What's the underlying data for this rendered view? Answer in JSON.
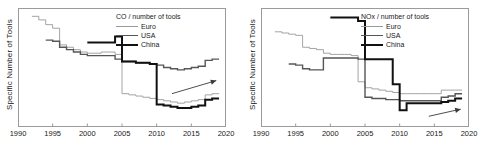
{
  "figure": {
    "width": 486,
    "height": 160,
    "background": "#ffffff"
  },
  "colors": {
    "euro": "#9a9a9a",
    "usa": "#565656",
    "china": "#111111",
    "axis": "#9b9b9b",
    "text": "#1a1a1a",
    "arrow": "#3a3a3a"
  },
  "panels": [
    {
      "id": "co-panel",
      "ylabel": "Specific Number of Tools",
      "legend": {
        "title": "CO / number of tools",
        "entries": [
          {
            "label": "Euro",
            "color": "#9a9a9a",
            "width": 0.9
          },
          {
            "label": "USA",
            "color": "#565656",
            "width": 1.4
          },
          {
            "label": "China",
            "color": "#111111",
            "width": 2.0
          }
        ]
      },
      "annotation": {
        "type": "arrow",
        "label": ""
      }
    },
    {
      "id": "nox-panel",
      "ylabel": "Specific Number of Tools",
      "legend": {
        "title": "NOx / number of tools",
        "entries": [
          {
            "label": "Euro",
            "color": "#9a9a9a",
            "width": 0.9
          },
          {
            "label": "USA",
            "color": "#565656",
            "width": 1.4
          },
          {
            "label": "China",
            "color": "#111111",
            "width": 2.0
          }
        ]
      },
      "annotation": {
        "type": "arrow",
        "label": ""
      }
    }
  ],
  "chart_data": [
    {
      "type": "line",
      "id": "co-chart",
      "title": "CO / number of tools",
      "xlabel": "",
      "ylabel": "Specific Number of Tools",
      "xlim": [
        1990,
        2020
      ],
      "ylim": [
        0,
        100
      ],
      "xticks": [
        1990,
        1995,
        2000,
        2005,
        2010,
        2015,
        2020
      ],
      "yticks": [],
      "grid": false,
      "legend_position": "top-right",
      "step": "post",
      "series": [
        {
          "name": "Euro",
          "color": "#9a9a9a",
          "x": [
            1992,
            1993,
            1994,
            1995,
            1996,
            1997,
            1998,
            1999,
            2000,
            2001,
            2002,
            2003,
            2004,
            2005,
            2006,
            2007,
            2008,
            2009,
            2010,
            2011,
            2012,
            2013,
            2014,
            2015,
            2016,
            2017,
            2018,
            2019
          ],
          "values": [
            93,
            90,
            86,
            83,
            69,
            67,
            65,
            63,
            62,
            62,
            63,
            63,
            61,
            28,
            27,
            26,
            25,
            24,
            23,
            22,
            21,
            20,
            21,
            22,
            23,
            27,
            28,
            28
          ]
        },
        {
          "name": "USA",
          "color": "#565656",
          "x": [
            1994,
            1995,
            1996,
            1997,
            1998,
            1999,
            2000,
            2001,
            2002,
            2003,
            2004,
            2005,
            2006,
            2007,
            2008,
            2009,
            2010,
            2011,
            2012,
            2013,
            2014,
            2015,
            2016,
            2017,
            2018,
            2019
          ],
          "values": [
            73,
            72,
            67,
            65,
            63,
            61,
            60,
            60,
            60,
            60,
            57,
            55,
            55,
            54,
            54,
            53,
            52,
            50,
            49,
            48,
            49,
            50,
            51,
            56,
            57,
            57
          ]
        },
        {
          "name": "China",
          "color": "#111111",
          "x": [
            2000,
            2001,
            2002,
            2003,
            2004,
            2005,
            2006,
            2007,
            2008,
            2009,
            2010,
            2011,
            2012,
            2013,
            2014,
            2015,
            2016,
            2017,
            2018,
            2019
          ],
          "values": [
            71,
            71,
            71,
            71,
            76,
            55,
            55,
            54,
            54,
            53,
            19,
            18,
            17,
            16,
            16,
            17,
            18,
            23,
            24,
            24
          ]
        }
      ],
      "annotations": [
        {
          "type": "arrow",
          "x_start": 2012.2,
          "y_start": 28,
          "x_end": 2018.6,
          "y_end": 39
        }
      ]
    },
    {
      "type": "line",
      "id": "nox-chart",
      "title": "NOx / number of tools",
      "xlabel": "",
      "ylabel": "Specific Number of Tools",
      "xlim": [
        1990,
        2020
      ],
      "ylim": [
        0,
        100
      ],
      "xticks": [
        1990,
        1995,
        2000,
        2005,
        2010,
        2015,
        2020
      ],
      "yticks": [],
      "grid": false,
      "legend_position": "top-right",
      "step": "post",
      "series": [
        {
          "name": "Euro",
          "color": "#9a9a9a",
          "x": [
            1992,
            1993,
            1994,
            1995,
            1996,
            1997,
            1998,
            1999,
            2000,
            2001,
            2002,
            2003,
            2004,
            2005,
            2006,
            2007,
            2008,
            2009,
            2010,
            2011,
            2012,
            2013,
            2014,
            2015,
            2016,
            2017,
            2018,
            2019
          ],
          "values": [
            80,
            79,
            78,
            77,
            67,
            66,
            65,
            62,
            61,
            61,
            61,
            60,
            38,
            33,
            32,
            31,
            30,
            29,
            28,
            28,
            28,
            28,
            28,
            28,
            31,
            31,
            31,
            31
          ]
        },
        {
          "name": "USA",
          "color": "#565656",
          "x": [
            1994,
            1995,
            1996,
            1997,
            1998,
            1999,
            2000,
            2001,
            2002,
            2003,
            2004,
            2005,
            2006,
            2007,
            2008,
            2009,
            2010,
            2011,
            2012,
            2013,
            2014,
            2015,
            2016,
            2017,
            2018,
            2019
          ],
          "values": [
            53,
            52,
            49,
            48,
            48,
            58,
            58,
            58,
            58,
            58,
            57,
            25,
            24,
            24,
            23,
            23,
            22,
            22,
            22,
            22,
            22,
            22,
            25,
            26,
            28,
            28
          ]
        },
        {
          "name": "China",
          "color": "#111111",
          "x": [
            2000,
            2001,
            2002,
            2003,
            2004,
            2005,
            2006,
            2007,
            2008,
            2009,
            2010,
            2011,
            2012,
            2013,
            2014,
            2015,
            2016,
            2017,
            2018,
            2019
          ],
          "values": [
            92,
            92,
            92,
            92,
            89,
            57,
            57,
            57,
            57,
            36,
            14,
            20,
            20,
            20,
            20,
            20,
            21,
            22,
            24,
            24
          ]
        }
      ],
      "annotations": [
        {
          "type": "arrow",
          "x_start": 2014.2,
          "y_start": 9,
          "x_end": 2018.8,
          "y_end": 15
        }
      ]
    }
  ]
}
